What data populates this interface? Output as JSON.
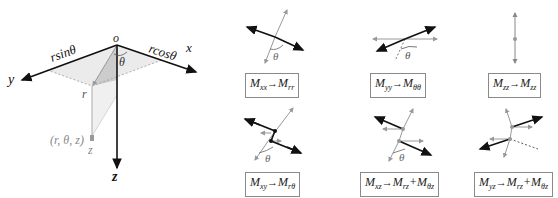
{
  "coordinate_system": {
    "origin_label": "o",
    "axes": [
      {
        "name": "x",
        "label": "x"
      },
      {
        "name": "y",
        "label": "y"
      },
      {
        "name": "z",
        "label": "z"
      }
    ],
    "labels": {
      "rsin": "rsinθ",
      "rcos": "rcosθ",
      "theta": "θ",
      "r": "r",
      "z": "z",
      "point": "(r, θ, z)"
    }
  },
  "transforms": [
    {
      "id": "xx",
      "from": "M",
      "from_sub": "xx",
      "to": "M",
      "to_sub": "rr",
      "extra": "",
      "extra_sub": "",
      "angle": "θ"
    },
    {
      "id": "yy",
      "from": "M",
      "from_sub": "yy",
      "to": "M",
      "to_sub": "θθ",
      "extra": "",
      "extra_sub": "",
      "angle": "θ"
    },
    {
      "id": "zz",
      "from": "M",
      "from_sub": "zz",
      "to": "M",
      "to_sub": "zz",
      "extra": "",
      "extra_sub": "",
      "angle": ""
    },
    {
      "id": "xy",
      "from": "M",
      "from_sub": "xy",
      "to": "M",
      "to_sub": "rθ",
      "extra": "",
      "extra_sub": "",
      "angle": "θ"
    },
    {
      "id": "xz",
      "from": "M",
      "from_sub": "xz",
      "to": "M",
      "to_sub": "rz",
      "extra": "+M",
      "extra_sub": "θz",
      "angle": "θ"
    },
    {
      "id": "yz",
      "from": "M",
      "from_sub": "yz",
      "to": "M",
      "to_sub": "rz",
      "extra": "+M",
      "extra_sub": "θz",
      "angle": ""
    }
  ],
  "arrow_glyph": "⟶"
}
